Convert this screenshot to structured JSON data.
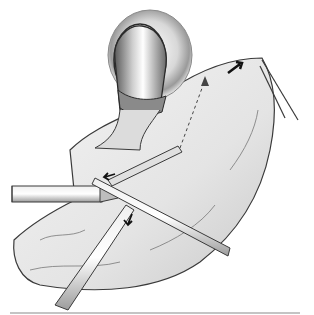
{
  "figure": {
    "colors": {
      "background": "#ffffff",
      "line": "#2a2a2a",
      "shade_dark": "#6b6b6b",
      "shade_mid": "#a8a8a8",
      "shade_light": "#dcdcdc"
    },
    "elements": {
      "ring_opening": "ring-shaped opening at top center",
      "organ_stump": "tubular organ passing through ring",
      "tissue_flap": "broad tissue flap",
      "instrument_left_horizontal": "horizontal trocar shaft from left",
      "instrument_diagonal": "diagonal instrument crossing to lower right",
      "instrument_lower_left": "grasper entering from lower left",
      "instrument_upper_right": "grasper at upper right corner",
      "arrows": [
        "upper-right traction arrow",
        "center-left arrow",
        "lower center arrow",
        "dashed movement arrow"
      ]
    }
  }
}
